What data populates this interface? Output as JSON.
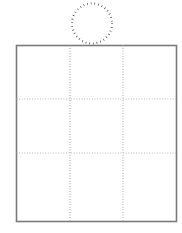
{
  "figure": {
    "canvas": {
      "width": 182,
      "height": 233,
      "background_color": "#ffffff"
    },
    "shapes": {
      "circle": {
        "name": "dotted-circle",
        "style": "dotted-outline",
        "center_x": 92,
        "center_y": 23.5,
        "radius": 20,
        "stroke_color": "#3a3a3a",
        "stroke_width": 2.1,
        "dash_pattern": "0.6 3.1",
        "fill": "none"
      },
      "square": {
        "name": "solid-square",
        "style": "solid-outline",
        "x": 16.5,
        "y": 45.5,
        "width": 160,
        "height": 176,
        "stroke_color": "#7a7a7a",
        "stroke_width": 1.6,
        "fill": "#ffffff"
      },
      "grid": {
        "name": "dotted-grid",
        "rows": 3,
        "columns": 3,
        "stroke_color": "#b0b0b0",
        "stroke_width": 1.2,
        "dash_pattern": "1 1.6",
        "vertical_lines_x": [
          70,
          123
        ],
        "horizontal_lines_y": [
          99,
          153
        ]
      }
    },
    "annotations": {
      "circle_label": "",
      "square_label": "",
      "caption": ""
    }
  }
}
